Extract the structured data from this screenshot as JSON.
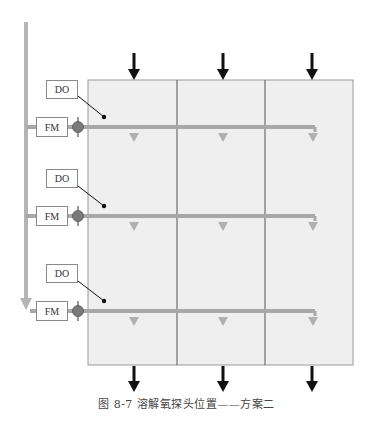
{
  "figure": {
    "caption": "图 8-7   溶解氧探头位置——方案二",
    "caption_number": "图 8-7",
    "caption_title": "溶解氧探头位置——方案二"
  },
  "tank": {
    "columns": 3,
    "rows": 3,
    "fill_color": "#efefef",
    "border_color": "#9a9a9a",
    "divider_color": "#555555"
  },
  "labels": {
    "do": [
      "DO",
      "DO",
      "DO"
    ],
    "fm": [
      "FM",
      "FM",
      "FM"
    ]
  },
  "flow": {
    "inflow_arrows": 3,
    "outflow_arrows": 3,
    "arrow_color": "#111111",
    "air_pipe_color": "#a8a8a8",
    "diffuser_arrows_per_row": 3
  },
  "valve": {
    "color": "#777777"
  }
}
